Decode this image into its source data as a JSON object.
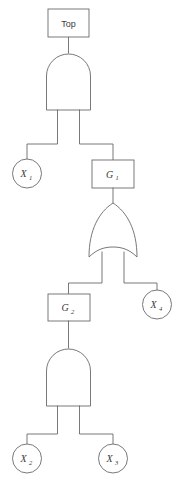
{
  "diagram": {
    "type": "fault-tree",
    "background_color": "#ffffff",
    "line_color": "#6a6a6a",
    "text_color": "#3a3a3a",
    "nodes": {
      "top": {
        "label": "Top",
        "shape": "rectangle",
        "kind": "top-event"
      },
      "g1": {
        "label": "G",
        "sub": "1",
        "shape": "rectangle",
        "kind": "intermediate-event"
      },
      "g2": {
        "label": "G",
        "sub": "2",
        "shape": "rectangle",
        "kind": "intermediate-event"
      },
      "x1": {
        "label": "X",
        "sub": "1",
        "shape": "circle",
        "kind": "basic-event"
      },
      "x2": {
        "label": "X",
        "sub": "2",
        "shape": "circle",
        "kind": "basic-event"
      },
      "x3": {
        "label": "X",
        "sub": "3",
        "shape": "circle",
        "kind": "basic-event"
      },
      "x4": {
        "label": "X",
        "sub": "4",
        "shape": "circle",
        "kind": "basic-event"
      }
    },
    "gates": {
      "and_top": {
        "type": "AND",
        "output": "top",
        "inputs": [
          "x1",
          "g1"
        ]
      },
      "or_mid": {
        "type": "OR",
        "output": "g1",
        "inputs": [
          "g2",
          "x4"
        ]
      },
      "and_bottom": {
        "type": "AND",
        "output": "g2",
        "inputs": [
          "x2",
          "x3"
        ]
      }
    },
    "structure_expression": "Top = X1 AND (G2 OR X4), G2 = X2 AND X3"
  }
}
